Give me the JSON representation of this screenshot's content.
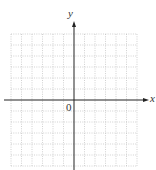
{
  "diagram": {
    "type": "coordinate-grid",
    "x_axis_label": "x",
    "y_axis_label": "y",
    "origin_label": "0",
    "grid": {
      "columns": 12,
      "rows": 12,
      "line_style": "dotted",
      "color": "#b8b8b8"
    },
    "axis_color": "#222222"
  }
}
